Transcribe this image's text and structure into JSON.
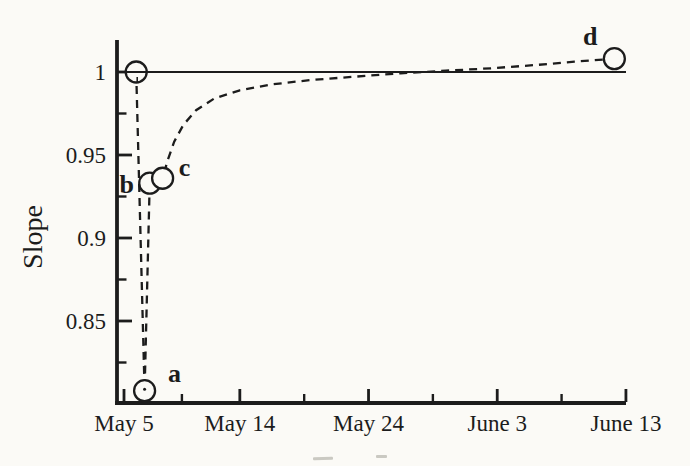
{
  "meta": {
    "figure_kind": "scanned line chart",
    "colors": {
      "paper": "#fbfaf6",
      "ink": "#1c1c1c",
      "artifact": "#b9b8b0"
    }
  },
  "chart_data": {
    "type": "line",
    "title": "",
    "xlabel": "",
    "ylabel": "Slope",
    "grid": "off",
    "legend": "none",
    "x_axis": {
      "kind": "date",
      "tick_labels": [
        "May 5",
        "May 14",
        "May 24",
        "June 3",
        "June 13"
      ],
      "tick_days": [
        0,
        9,
        19,
        29,
        39
      ],
      "minor_tick_days": [
        4.5,
        14,
        24,
        34
      ]
    },
    "y_axis": {
      "label": "Slope",
      "tick_labels": [
        "1",
        "0.95",
        "0.9",
        "0.85"
      ],
      "tick_values": [
        1,
        0.95,
        0.9,
        0.85
      ],
      "minor_tick_values": [
        0.975,
        0.925,
        0.875,
        0.825
      ],
      "range": [
        0.8,
        1.02
      ]
    },
    "reference_line": {
      "style": "solid",
      "value": 1.0
    },
    "series": [
      {
        "name": "slope-vs-time",
        "line_style": "dashed",
        "marker": "open-circle",
        "points": [
          {
            "label": "",
            "date": "May 6",
            "day": 0.95,
            "value": 1.0
          },
          {
            "label": "a",
            "date": "May 6",
            "day": 1.6,
            "value": 0.808
          },
          {
            "label": "b",
            "date": "May 7",
            "day": 2.0,
            "value": 0.933
          },
          {
            "label": "c",
            "date": "May 8",
            "day": 3.0,
            "value": 0.936
          },
          {
            "label": "d",
            "date": "June 12",
            "day": 38.1,
            "value": 1.008
          }
        ],
        "curve_samples": [
          [
            0.95,
            1.0
          ],
          [
            1.6,
            0.808
          ],
          [
            2.0,
            0.933
          ],
          [
            3.0,
            0.936
          ],
          [
            3.4,
            0.947
          ],
          [
            3.9,
            0.958
          ],
          [
            4.6,
            0.968
          ],
          [
            5.6,
            0.977
          ],
          [
            7.0,
            0.984
          ],
          [
            9.0,
            0.989
          ],
          [
            11.5,
            0.9925
          ],
          [
            14.5,
            0.9952
          ],
          [
            18.0,
            0.9972
          ],
          [
            21.5,
            0.9992
          ],
          [
            25.0,
            1.0008
          ],
          [
            28.5,
            1.0022
          ],
          [
            32.0,
            1.0042
          ],
          [
            35.0,
            1.0062
          ],
          [
            38.1,
            1.008
          ]
        ]
      }
    ]
  }
}
